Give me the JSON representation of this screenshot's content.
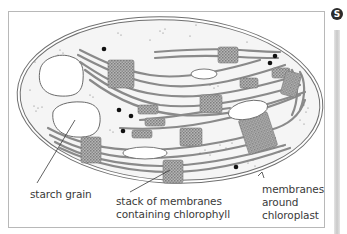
{
  "figure": {
    "badge_letter": "S",
    "subject": "chloroplast",
    "labels": {
      "starch_grain": "starch grain",
      "stack_line1": "stack of membranes",
      "stack_line2": "containing chlorophyll",
      "membranes_line1": "membranes",
      "membranes_line2": "around",
      "membranes_line3": "chloroplast"
    },
    "colors": {
      "outline": "#6e6e6e",
      "stroma": "#f4f4f4",
      "grana": "#9a9a9a",
      "starch": "#ffffff",
      "dots": "#111111",
      "label_text": "#3a3a3a"
    }
  }
}
